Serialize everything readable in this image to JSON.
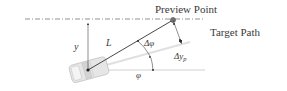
{
  "diagram": {
    "labels": {
      "preview_point": "Preview Point",
      "target_path": "Target Path",
      "y": "y",
      "L": "L",
      "delta_phi": "Δφ",
      "delta_y": "Δy",
      "delta_y_sub": "p",
      "phi": "φ"
    },
    "colors": {
      "line": "#333333",
      "heading_line": "#d8d8d8",
      "reference_line": "#bdbdbd",
      "target_path": "#666666",
      "preview_point": "#555555",
      "vehicle": "#c8c8c8"
    }
  }
}
